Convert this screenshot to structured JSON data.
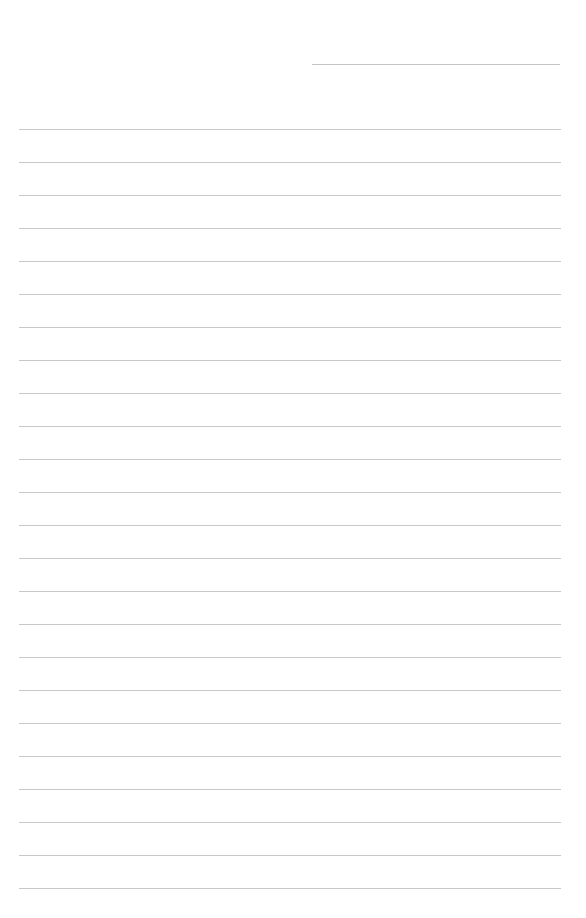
{
  "page": {
    "type": "lined-paper",
    "background_color": "#ffffff",
    "line_color": "#c8c8c8",
    "header_line": {
      "x_start": 312,
      "x_end": 560,
      "y": 64,
      "color": "#c4c4c4"
    },
    "ruled_lines": {
      "count": 24,
      "first_y": 129,
      "spacing": 33,
      "x_start": 19,
      "x_end": 561
    }
  }
}
